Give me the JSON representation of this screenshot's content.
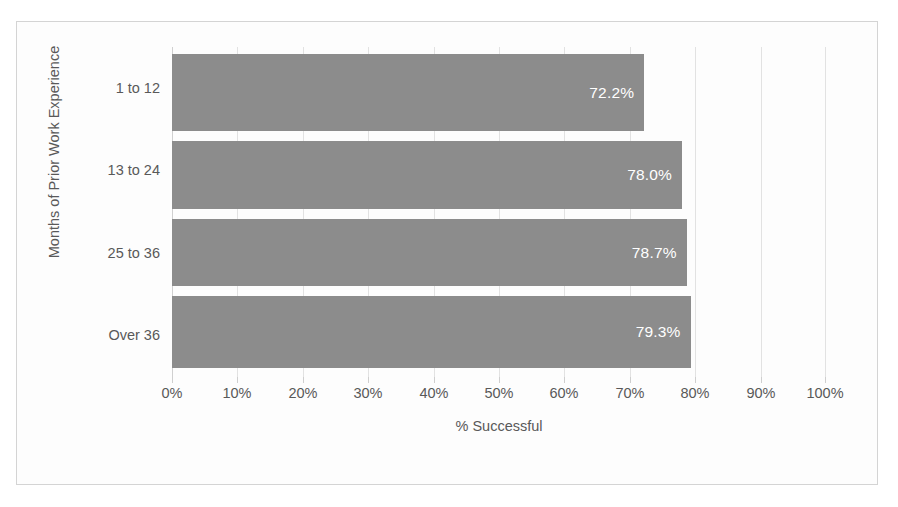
{
  "chart_data": {
    "type": "bar",
    "orientation": "horizontal",
    "title": "",
    "xlabel": "% Successful",
    "ylabel": "Months of Prior Work Experience",
    "categories": [
      "1 to 12",
      "13 to 24",
      "25 to 36",
      "Over 36"
    ],
    "values": [
      72.2,
      78.0,
      78.7,
      79.3
    ],
    "data_labels": [
      "72.2%",
      "78.0%",
      "78.7%",
      "79.3%"
    ],
    "xlim": [
      0,
      100
    ],
    "xticks": [
      0,
      10,
      20,
      30,
      40,
      50,
      60,
      70,
      80,
      90,
      100
    ],
    "xtick_labels": [
      "0%",
      "10%",
      "20%",
      "30%",
      "40%",
      "50%",
      "60%",
      "70%",
      "80%",
      "90%",
      "100%"
    ],
    "grid": true,
    "grid_axis": "x",
    "legend": false,
    "series": [
      {
        "name": "% Successful",
        "values": [
          72.2,
          78.0,
          78.7,
          79.3
        ]
      }
    ]
  },
  "colors": {
    "bar": "#8c8c8c",
    "data_label": "#ffffff",
    "axis_text": "#595959",
    "gridline": "#e2e2e2",
    "frame_border": "#d4d4d4",
    "plot_background": "#fdfdfd"
  }
}
